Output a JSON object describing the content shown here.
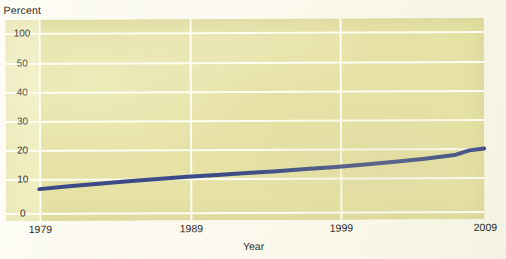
{
  "figure": {
    "y_axis_title": "Percent",
    "x_axis_title": "Year"
  },
  "colors": {
    "plot_background": "#e6e2a6",
    "gridline": "#fdfdf2",
    "series_line": "#3c4a87",
    "page_background": "#fdfcf6",
    "tick_text": "#2b2b2b"
  },
  "chart_data": {
    "type": "line",
    "title": "",
    "subtitle": "",
    "xlabel": "Year",
    "ylabel": "Percent",
    "grid": true,
    "legend_position": "none",
    "xlim": [
      1979,
      2009
    ],
    "ylim": [
      0,
      100
    ],
    "x_tick_labels": [
      "1979",
      "1989",
      "1999",
      "2009"
    ],
    "x_ticks": [
      1979,
      1989,
      1999,
      2009
    ],
    "y_tick_labels": [
      "100",
      "50",
      "40",
      "30",
      "20",
      "10",
      "0"
    ],
    "y_ticks": [
      100,
      50,
      40,
      30,
      20,
      10,
      0
    ],
    "y_axis_note": "Non-linear axis: 100 and 50 share one band, then even 10-point bands to 0",
    "series": [
      {
        "name": "Percent",
        "color": "#3c4a87",
        "x": [
          1979,
          1981,
          1983,
          1985,
          1987,
          1989,
          1991,
          1993,
          1995,
          1997,
          1999,
          2001,
          2003,
          2005,
          2007,
          2008,
          2009
        ],
        "values": [
          7,
          7.8,
          8.5,
          9.2,
          9.8,
          10.5,
          11.1,
          11.7,
          12.3,
          13,
          13.7,
          14.5,
          15.4,
          16.4,
          17.6,
          19.2,
          19.8
        ]
      }
    ]
  },
  "geometry": {
    "plot_left_px": 6,
    "plot_top_px": 19,
    "plot_width_px": 478,
    "plot_height_px": 201,
    "y_grid_px": [
      13,
      43,
      72,
      101,
      130,
      159,
      193
    ],
    "x_grid_px": [
      33,
      184,
      334,
      478
    ]
  }
}
